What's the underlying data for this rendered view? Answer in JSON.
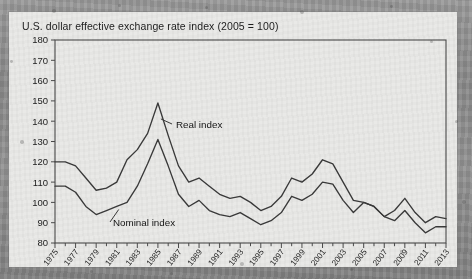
{
  "figure": {
    "title": "U.S. dollar effective exchange rate index (2005 = 100)",
    "background_color": "#e9e9e7",
    "line_color": "#3a3a3a",
    "frame_color": "#4a4a4a"
  },
  "annotations": {
    "real_label": "Real index",
    "nominal_label": "Nominal index"
  },
  "chart_data": {
    "type": "line",
    "title": "U.S. dollar effective exchange rate index (2005 = 100)",
    "xlabel": "",
    "ylabel": "",
    "ylim": [
      80,
      180
    ],
    "ytick_labels": [
      "80",
      "90",
      "100",
      "110",
      "120",
      "130",
      "140",
      "150",
      "160",
      "170",
      "180"
    ],
    "yticks": [
      80,
      90,
      100,
      110,
      120,
      130,
      140,
      150,
      160,
      170,
      180
    ],
    "xlim": [
      1975,
      2013
    ],
    "xtick_labels": [
      "1975",
      "1977",
      "1979",
      "1981",
      "1983",
      "1985",
      "1987",
      "1989",
      "1991",
      "1993",
      "1995",
      "1997",
      "1999",
      "2001",
      "2003",
      "2005",
      "2007",
      "2009",
      "2011",
      "2013"
    ],
    "xticks": [
      1975,
      1977,
      1979,
      1981,
      1983,
      1985,
      1987,
      1989,
      1991,
      1993,
      1995,
      1997,
      1999,
      2001,
      2003,
      2005,
      2007,
      2009,
      2011,
      2013
    ],
    "minor_xticks_every": 1,
    "grid": false,
    "legend": "inline-annotations",
    "x": [
      1975,
      1976,
      1977,
      1978,
      1979,
      1980,
      1981,
      1982,
      1983,
      1984,
      1985,
      1986,
      1987,
      1988,
      1989,
      1990,
      1991,
      1992,
      1993,
      1994,
      1995,
      1996,
      1997,
      1998,
      1999,
      2000,
      2001,
      2002,
      2003,
      2004,
      2005,
      2006,
      2007,
      2008,
      2009,
      2010,
      2011,
      2012,
      2013
    ],
    "series": [
      {
        "name": "Real index",
        "values": [
          120,
          120,
          118,
          112,
          106,
          107,
          110,
          121,
          126,
          134,
          149,
          133,
          118,
          110,
          112,
          108,
          104,
          102,
          103,
          100,
          96,
          98,
          103,
          112,
          110,
          114,
          121,
          119,
          110,
          101,
          100,
          98,
          93,
          96,
          102,
          95,
          90,
          93,
          92
        ]
      },
      {
        "name": "Nominal index",
        "values": [
          108,
          108,
          105,
          98,
          94,
          96,
          98,
          100,
          108,
          119,
          131,
          118,
          104,
          98,
          101,
          96,
          94,
          93,
          95,
          92,
          89,
          91,
          95,
          103,
          101,
          104,
          110,
          109,
          101,
          95,
          100,
          98,
          93,
          91,
          96,
          90,
          85,
          88,
          88
        ]
      }
    ],
    "annotations": [
      {
        "text": "Real index",
        "points_to_year": 1985,
        "position": "right-of-peak"
      },
      {
        "text": "Nominal index",
        "points_to_year": 1981,
        "position": "below-trough"
      }
    ]
  }
}
